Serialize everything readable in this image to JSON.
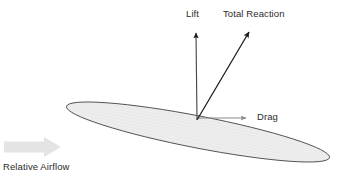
{
  "diagram": {
    "background_color": "#ffffff",
    "labels": {
      "lift": "Lift",
      "total_reaction": "Total Reaction",
      "drag": "Drag",
      "relative_airflow": "Relative Airflow"
    },
    "colors": {
      "vector_dark": "#1a1a1a",
      "vector_gray": "#808080",
      "airfoil_outline": "#4d4d4d",
      "airfoil_fill": "#eeeeee",
      "airflow_arrow": "#e4e4e4",
      "text": "#2b2b2b"
    },
    "airfoil": {
      "shape": "ellipse",
      "center_x": 198,
      "center_y": 132,
      "radius_x": 134,
      "radius_y": 16,
      "rotation_deg": 11
    },
    "vectors": [
      {
        "name": "lift",
        "label": "Lift",
        "origin_x": 197,
        "origin_y": 120,
        "tip_x": 196,
        "tip_y": 29,
        "color": "#1a1a1a",
        "direction": "up"
      },
      {
        "name": "total-reaction",
        "label": "Total Reaction",
        "origin_x": 197,
        "origin_y": 120,
        "tip_x": 251,
        "tip_y": 29,
        "color": "#1a1a1a",
        "direction": "up-right"
      },
      {
        "name": "drag",
        "label": "Drag",
        "origin_x": 197,
        "origin_y": 118,
        "tip_x": 253,
        "tip_y": 118,
        "color": "#808080",
        "direction": "right"
      }
    ],
    "airflow_arrow": {
      "name": "relative-airflow",
      "label": "Relative Airflow",
      "start_x": 4,
      "end_x": 61,
      "center_y": 147,
      "color": "#e4e4e4",
      "direction": "right"
    }
  }
}
